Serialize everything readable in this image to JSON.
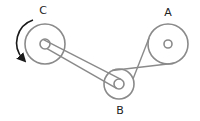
{
  "diagram": {
    "colors": {
      "stroke": "#8a8a8a",
      "arrow": "#1a1a1a",
      "label": "#222222"
    },
    "pulleys": [
      {
        "id": "C",
        "label": "C",
        "cx": 45,
        "cy": 44,
        "r": 20,
        "hub_r": 5
      },
      {
        "id": "B",
        "label": "B",
        "cx": 119,
        "cy": 84,
        "r": 15,
        "hub_r": 5
      },
      {
        "id": "A",
        "label": "A",
        "cx": 168,
        "cy": 44,
        "r": 20,
        "hub_r": 4
      }
    ],
    "belts": [
      {
        "from": "C",
        "to": "B",
        "type": "open",
        "on": "hub"
      },
      {
        "from": "B",
        "to": "A",
        "type": "crossed",
        "on": "rim"
      }
    ],
    "rotation_arrow": {
      "pulley": "C",
      "direction": "counterclockwise"
    },
    "labels": {
      "a": "A",
      "b": "B",
      "c": "C"
    }
  }
}
